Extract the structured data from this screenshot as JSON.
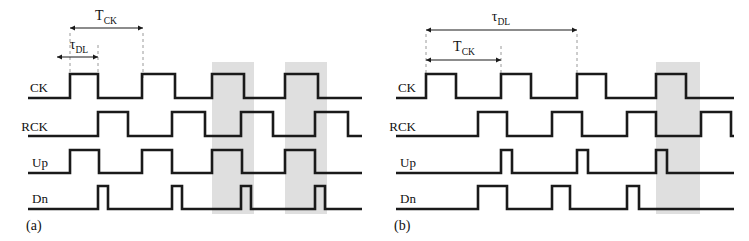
{
  "figure": {
    "type": "timing-diagram",
    "background_color": "#ffffff",
    "wave_color": "#1a1a1a",
    "band_color": "#d9d9d9",
    "dash_color": "#9a9a9a"
  },
  "panels": [
    {
      "id": "a",
      "label": "(a)",
      "dimensions": [
        {
          "name": "T_CK",
          "symbol": "T",
          "subscript": "CK",
          "x1": 70,
          "x2": 143,
          "y": 28,
          "label_x": 106,
          "label_y": 20
        },
        {
          "name": "tau_DL",
          "symbol": "τ",
          "subscript": "DL",
          "x1": 57,
          "x2": 98,
          "y": 57,
          "label_x": 79,
          "label_y": 49
        }
      ],
      "guides": [
        {
          "x": 70,
          "y1": 33,
          "y2": 78
        },
        {
          "x": 98,
          "y1": 45,
          "y2": 78
        },
        {
          "x": 143,
          "y1": 33,
          "y2": 78
        }
      ],
      "bands": [
        {
          "x": 212,
          "width": 42,
          "y": 62,
          "height": 152
        },
        {
          "x": 285,
          "width": 42,
          "y": 62,
          "height": 152
        }
      ],
      "signals": [
        {
          "name": "CK",
          "label": "CK",
          "label_x": 48,
          "label_y": 92,
          "baseline_y": 98,
          "top_y": 74,
          "x_start": 28,
          "x_end": 362,
          "edges": [
            70,
            98,
            142,
            175,
            212,
            244,
            285,
            318
          ]
        },
        {
          "name": "RCK",
          "label": "RCK",
          "label_x": 48,
          "label_y": 131,
          "baseline_y": 136,
          "top_y": 112,
          "x_start": 28,
          "x_end": 362,
          "edges": [
            98,
            128,
            172,
            205,
            241,
            273,
            315,
            348
          ]
        },
        {
          "name": "Up",
          "label": "Up",
          "label_x": 48,
          "label_y": 167,
          "baseline_y": 173,
          "top_y": 150,
          "x_start": 28,
          "x_end": 362,
          "edges": [
            70,
            99,
            142,
            172,
            212,
            242,
            285,
            315
          ]
        },
        {
          "name": "Dn",
          "label": "Dn",
          "label_x": 48,
          "label_y": 203,
          "baseline_y": 209,
          "top_y": 186,
          "x_start": 28,
          "x_end": 362,
          "edges": [
            98,
            108,
            172,
            182,
            241,
            251,
            315,
            325
          ]
        }
      ]
    },
    {
      "id": "b",
      "label": "(b)",
      "dimensions": [
        {
          "name": "tau_DL",
          "symbol": "τ",
          "subscript": "DL",
          "x1": 52,
          "x2": 203,
          "y": 30,
          "label_x": 127,
          "label_y": 21
        },
        {
          "name": "T_CK",
          "symbol": "T",
          "subscript": "CK",
          "x1": 52,
          "x2": 127,
          "y": 60,
          "label_x": 90,
          "label_y": 51
        }
      ],
      "guides": [
        {
          "x": 52,
          "y1": 34,
          "y2": 78
        },
        {
          "x": 127,
          "y1": 46,
          "y2": 78
        },
        {
          "x": 203,
          "y1": 34,
          "y2": 100
        }
      ],
      "bands": [
        {
          "x": 282,
          "width": 44,
          "y": 62,
          "height": 152
        }
      ],
      "signals": [
        {
          "name": "CK",
          "label": "CK",
          "label_x": 42,
          "label_y": 92,
          "baseline_y": 98,
          "top_y": 74,
          "x_start": 22,
          "x_end": 360,
          "edges": [
            52,
            82,
            127,
            157,
            203,
            232,
            282,
            312
          ]
        },
        {
          "name": "RCK",
          "label": "RCK",
          "label_x": 42,
          "label_y": 131,
          "baseline_y": 136,
          "top_y": 112,
          "x_start": 22,
          "x_end": 360,
          "edges": [
            104,
            133,
            178,
            208,
            253,
            282,
            327,
            357
          ]
        },
        {
          "name": "Up",
          "label": "Up",
          "label_x": 42,
          "label_y": 167,
          "baseline_y": 173,
          "top_y": 150,
          "x_start": 22,
          "x_end": 360,
          "edges": [
            127,
            138,
            203,
            214,
            282,
            293
          ]
        },
        {
          "name": "Dn",
          "label": "Dn",
          "label_x": 42,
          "label_y": 203,
          "baseline_y": 209,
          "top_y": 186,
          "x_start": 22,
          "x_end": 360,
          "edges": [
            104,
            133,
            178,
            196,
            253,
            265
          ]
        }
      ]
    }
  ]
}
